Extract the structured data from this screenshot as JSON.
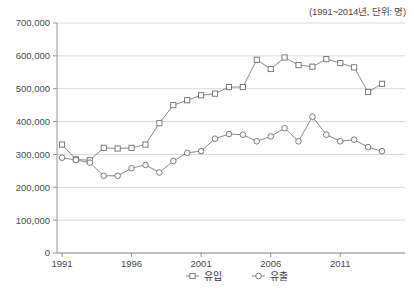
{
  "header": {
    "note": "(1991~2014년, 단위: 명)"
  },
  "chart_data": {
    "type": "line",
    "title": "",
    "subtitle": "(1991~2014년, 단위: 명)",
    "xlabel": "",
    "ylabel": "",
    "unit": "명",
    "period": "1991~2014",
    "grid": true,
    "legend_position": "bottom",
    "xlim": [
      1991,
      2014
    ],
    "ylim": [
      0,
      700000
    ],
    "ytick_values": [
      0,
      100000,
      200000,
      300000,
      400000,
      500000,
      600000,
      700000
    ],
    "ytick_labels": [
      "0",
      "100,000",
      "200,000",
      "300,000",
      "400,000",
      "500,000",
      "600,000",
      "700,000"
    ],
    "xtick_values": [
      1991,
      1996,
      2001,
      2006,
      2011
    ],
    "xtick_labels": [
      "1991",
      "1996",
      "2001",
      "2006",
      "2011"
    ],
    "x": [
      1991,
      1992,
      1993,
      1994,
      1995,
      1996,
      1997,
      1998,
      1999,
      2000,
      2001,
      2002,
      2003,
      2004,
      2005,
      2006,
      2007,
      2008,
      2009,
      2010,
      2011,
      2012,
      2013,
      2014
    ],
    "series": [
      {
        "name": "유입",
        "marker": "square",
        "color": "#6e6e6e",
        "values": [
          330000,
          285000,
          282000,
          320000,
          318000,
          320000,
          330000,
          395000,
          450000,
          465000,
          480000,
          485000,
          505000,
          505000,
          588000,
          560000,
          595000,
          572000,
          567000,
          590000,
          578000,
          565000,
          490000,
          515000
        ]
      },
      {
        "name": "유출",
        "marker": "circle",
        "color": "#6e6e6e",
        "values": [
          290000,
          283000,
          275000,
          235000,
          235000,
          258000,
          268000,
          245000,
          280000,
          305000,
          310000,
          348000,
          362000,
          360000,
          340000,
          355000,
          380000,
          340000,
          415000,
          360000,
          340000,
          345000,
          322000,
          310000
        ]
      }
    ]
  },
  "legend": {
    "items": [
      {
        "label": "유입",
        "marker": "square"
      },
      {
        "label": "유출",
        "marker": "circle"
      }
    ]
  }
}
